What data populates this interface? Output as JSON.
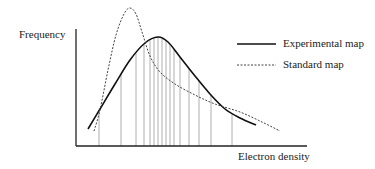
{
  "chart_data": {
    "type": "line",
    "title": "",
    "xlabel": "Electron density",
    "ylabel": "Frequency",
    "grid": false,
    "legend_position": "upper-right",
    "series": [
      {
        "name": "Experimental map",
        "style": "solid",
        "color": "#111111",
        "x": [
          88,
          100,
          115,
          130,
          145,
          158,
          168,
          180,
          195,
          210,
          225,
          240,
          256
        ],
        "y": [
          129,
          109,
          84,
          60,
          43,
          37,
          42,
          57,
          76,
          94,
          109,
          118,
          125
        ]
      },
      {
        "name": "Standard map",
        "style": "dashed",
        "color": "#333333",
        "x": [
          94,
          100,
          108,
          116,
          124,
          130,
          136,
          142,
          150,
          160,
          175,
          195,
          215,
          240,
          262,
          280
        ],
        "y": [
          131,
          110,
          70,
          35,
          14,
          8,
          14,
          32,
          56,
          72,
          84,
          95,
          104,
          112,
          122,
          131
        ]
      }
    ],
    "vertical_lines_x": [
      99,
      121,
      136,
      144,
      150,
      154,
      158,
      162,
      166,
      170,
      174,
      180,
      189,
      199,
      211,
      232
    ],
    "axis_origin": [
      76,
      146
    ],
    "axis_x_end": 307,
    "axis_y_top": 29
  },
  "labels": {
    "ylabel": "Frequency",
    "xlabel": "Electron density",
    "legend_experimental": "Experimental map",
    "legend_standard": "Standard map"
  }
}
